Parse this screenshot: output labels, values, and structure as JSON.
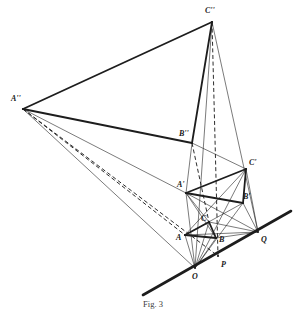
{
  "figure": {
    "caption": "Fig. 3",
    "stroke_color": "#1d1d1d",
    "background": "#ffffff",
    "width": 306,
    "height": 315
  },
  "points": {
    "A2": {
      "label": "A''",
      "x": 23,
      "y": 109,
      "lx": 11,
      "ly": 101
    },
    "B2": {
      "label": "B''",
      "x": 192,
      "y": 143,
      "lx": 179,
      "ly": 136
    },
    "C2": {
      "label": "C''",
      "x": 212,
      "y": 22,
      "lx": 205,
      "ly": 13
    },
    "A1": {
      "label": "A'",
      "x": 186,
      "y": 193,
      "lx": 177,
      "ly": 187
    },
    "B1": {
      "label": "B'",
      "x": 243,
      "y": 203,
      "lx": 243,
      "ly": 199
    },
    "C1": {
      "label": "C'",
      "x": 246,
      "y": 169,
      "lx": 249,
      "ly": 165
    },
    "A": {
      "label": "A",
      "x": 185,
      "y": 235,
      "lx": 176,
      "ly": 240
    },
    "B": {
      "label": "B",
      "x": 216,
      "y": 238,
      "lx": 219,
      "ly": 242
    },
    "C": {
      "label": "C",
      "x": 209,
      "y": 222,
      "lx": 201,
      "ly": 221
    },
    "O": {
      "label": "O",
      "x": 195,
      "y": 268,
      "lx": 192,
      "ly": 279
    },
    "P": {
      "label": "P",
      "x": 218,
      "y": 256,
      "lx": 221,
      "ly": 267
    },
    "Q": {
      "label": "Q",
      "x": 258,
      "y": 232,
      "lx": 261,
      "ly": 242
    }
  },
  "ground_line": {
    "name": "axis-line",
    "x1": 143,
    "y1": 295,
    "x2": 291,
    "y2": 211
  },
  "edges_thick": [
    {
      "name": "edge-A2-C2",
      "from": "A2",
      "to": "C2"
    },
    {
      "name": "edge-A2-B2",
      "from": "A2",
      "to": "B2"
    },
    {
      "name": "edge-B2-C2",
      "from": "B2",
      "to": "C2"
    },
    {
      "name": "edge-A-B",
      "from": "A",
      "to": "B"
    },
    {
      "name": "edge-B-C",
      "from": "B",
      "to": "C"
    },
    {
      "name": "edge-C-A",
      "from": "C",
      "to": "A"
    },
    {
      "name": "edge-A1-B1",
      "from": "A1",
      "to": "B1"
    },
    {
      "name": "edge-B1-C1",
      "from": "B1",
      "to": "C1"
    },
    {
      "name": "edge-C1-A1",
      "from": "C1",
      "to": "A1"
    }
  ],
  "edges_thin": [
    {
      "name": "ray-A2-A1",
      "from": "A2",
      "to": "A1"
    },
    {
      "name": "ray-A2-O",
      "from": "A2",
      "to": "O"
    },
    {
      "name": "ray-C2-Q",
      "from": "C2",
      "to": "Q"
    },
    {
      "name": "ray-C2-O",
      "from": "C2",
      "to": "O"
    },
    {
      "name": "ray-C1-Q",
      "from": "C1",
      "to": "Q"
    },
    {
      "name": "ray-B1-Q",
      "from": "B1",
      "to": "Q"
    },
    {
      "name": "ray-A1-Q",
      "from": "A1",
      "to": "Q"
    },
    {
      "name": "ray-A-Q",
      "from": "A",
      "to": "Q"
    },
    {
      "name": "ray-C-Q",
      "from": "C",
      "to": "Q"
    },
    {
      "name": "ray-B-Q",
      "from": "B",
      "to": "Q"
    },
    {
      "name": "ray-O-A1",
      "from": "O",
      "to": "A1"
    },
    {
      "name": "ray-O-C1",
      "from": "O",
      "to": "C1"
    },
    {
      "name": "ray-O-B1",
      "from": "O",
      "to": "B1"
    },
    {
      "name": "ray-O-A",
      "from": "O",
      "to": "A"
    },
    {
      "name": "ray-O-C",
      "from": "O",
      "to": "C"
    },
    {
      "name": "ray-O-B",
      "from": "O",
      "to": "B"
    },
    {
      "name": "ray-A1-C",
      "from": "A1",
      "to": "C"
    },
    {
      "name": "ray-A1-B",
      "from": "A1",
      "to": "B"
    },
    {
      "name": "ray-A-B1",
      "from": "A",
      "to": "B1"
    },
    {
      "name": "ray-A-C1",
      "from": "A",
      "to": "C1"
    },
    {
      "name": "ray-B2-A1",
      "from": "B2",
      "to": "A1"
    },
    {
      "name": "ray-B2-C1",
      "from": "B2",
      "to": "C1"
    }
  ],
  "edges_dashed": [
    {
      "name": "projector-C2-P",
      "from": "C2",
      "to": "P"
    },
    {
      "name": "projector-B2-C",
      "from": "B2",
      "to": "C"
    },
    {
      "name": "projector-A2-A",
      "from": "A2",
      "to": "A"
    },
    {
      "name": "projector-A2-P",
      "from": "A2",
      "to": "P"
    }
  ],
  "icons": {
    "vertex_dot": "vertex-dot"
  }
}
